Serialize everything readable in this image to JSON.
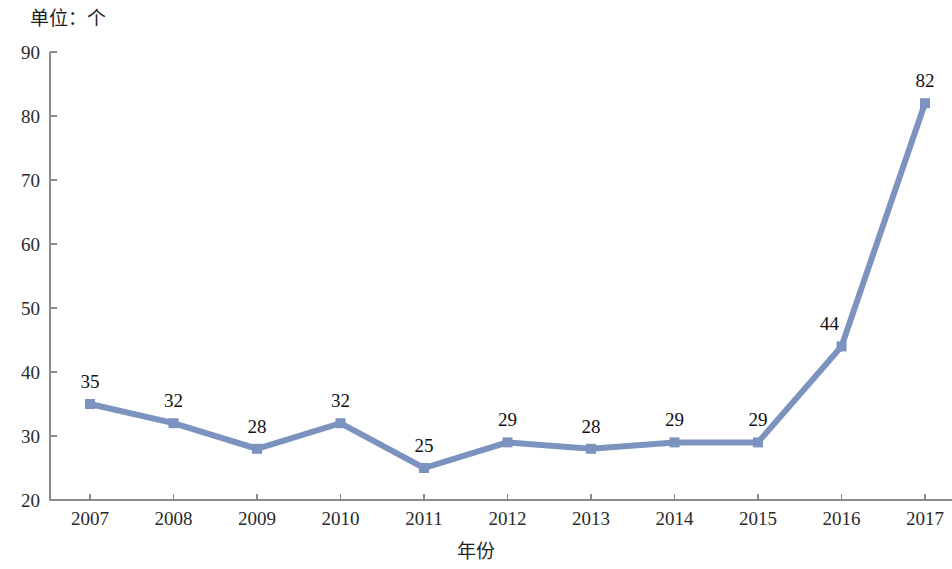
{
  "unit_caption": "单位：个",
  "xaxis_title": "年份",
  "accent_color": "#7b93be",
  "axis_color": "#8b8b8b",
  "chart_data": {
    "type": "line",
    "title": "",
    "subtitle": "",
    "xlabel": "年份",
    "ylabel": "",
    "unit_note": "单位：个",
    "categories": [
      "2007",
      "2008",
      "2009",
      "2010",
      "2011",
      "2012",
      "2013",
      "2014",
      "2015",
      "2016",
      "2017"
    ],
    "values": [
      35,
      32,
      28,
      32,
      25,
      29,
      28,
      29,
      29,
      44,
      82
    ],
    "data_labels": [
      "35",
      "32",
      "28",
      "32",
      "25",
      "29",
      "28",
      "29",
      "29",
      "44",
      "82"
    ],
    "series": [
      {
        "name": "数量",
        "values": [
          35,
          32,
          28,
          32,
          25,
          29,
          28,
          29,
          29,
          44,
          82
        ],
        "color": "#7b93be",
        "marker": "square"
      }
    ],
    "ylim": [
      20,
      90
    ],
    "yticks": [
      20,
      30,
      40,
      50,
      60,
      70,
      80,
      90
    ],
    "ytick_labels": [
      "20",
      "30",
      "40",
      "50",
      "60",
      "70",
      "80",
      "90"
    ],
    "xtick_labels": [
      "2007",
      "2008",
      "2009",
      "2010",
      "2011",
      "2012",
      "2013",
      "2014",
      "2015",
      "2016",
      "2017"
    ],
    "grid": false,
    "legend": false,
    "legend_position": "none"
  }
}
